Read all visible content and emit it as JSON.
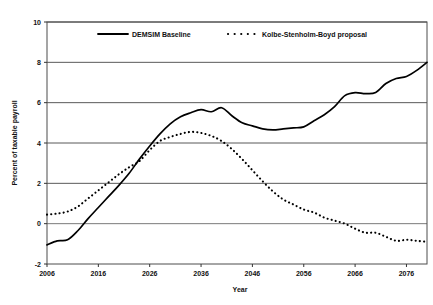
{
  "chart_data": {
    "type": "line",
    "title": "",
    "xlabel": "Year",
    "ylabel": "Percent of taxable payroll",
    "xlim": [
      2006,
      2080
    ],
    "ylim": [
      -2,
      10
    ],
    "xticks": [
      "2006",
      "2016",
      "2026",
      "2036",
      "2046",
      "2056",
      "2066",
      "2076"
    ],
    "xtick_values": [
      2006,
      2016,
      2026,
      2036,
      2046,
      2056,
      2066,
      2076
    ],
    "yticks": [
      "-2",
      "0",
      "2",
      "4",
      "6",
      "8",
      "10"
    ],
    "ytick_values": [
      -2,
      0,
      2,
      4,
      6,
      8,
      10
    ],
    "grid": "horizontal",
    "legend_position": "upper-center-inside",
    "series": [
      {
        "name": "DEMSIM Baseline",
        "style": "solid",
        "color": "#000000",
        "x": [
          2006,
          2008,
          2010,
          2012,
          2014,
          2016,
          2018,
          2020,
          2022,
          2024,
          2026,
          2028,
          2030,
          2032,
          2034,
          2036,
          2038,
          2040,
          2042,
          2044,
          2046,
          2048,
          2050,
          2052,
          2054,
          2056,
          2058,
          2060,
          2062,
          2064,
          2066,
          2068,
          2070,
          2072,
          2074,
          2076,
          2078,
          2080
        ],
        "values": [
          -1.05,
          -0.85,
          -0.8,
          -0.35,
          0.25,
          0.8,
          1.35,
          1.9,
          2.5,
          3.2,
          3.85,
          4.45,
          4.95,
          5.3,
          5.5,
          5.65,
          5.55,
          5.75,
          5.35,
          5.0,
          4.85,
          4.7,
          4.65,
          4.7,
          4.75,
          4.8,
          5.1,
          5.4,
          5.8,
          6.35,
          6.5,
          6.45,
          6.5,
          6.95,
          7.2,
          7.3,
          7.6,
          8.0
        ]
      },
      {
        "name": "Kolbe-Stenholm-Boyd proposal",
        "style": "dotted",
        "color": "#000000",
        "x": [
          2006,
          2008,
          2010,
          2012,
          2014,
          2016,
          2018,
          2020,
          2022,
          2024,
          2026,
          2028,
          2030,
          2032,
          2034,
          2036,
          2038,
          2040,
          2042,
          2044,
          2046,
          2048,
          2050,
          2052,
          2054,
          2056,
          2058,
          2060,
          2062,
          2064,
          2066,
          2068,
          2070,
          2072,
          2074,
          2076,
          2078,
          2080
        ],
        "values": [
          0.45,
          0.5,
          0.6,
          0.85,
          1.25,
          1.65,
          2.05,
          2.45,
          2.8,
          3.1,
          3.65,
          4.1,
          4.3,
          4.45,
          4.55,
          4.5,
          4.35,
          4.1,
          3.7,
          3.2,
          2.65,
          2.1,
          1.6,
          1.2,
          0.95,
          0.7,
          0.55,
          0.3,
          0.15,
          0.0,
          -0.25,
          -0.45,
          -0.45,
          -0.65,
          -0.85,
          -0.8,
          -0.85,
          -0.9
        ]
      }
    ]
  },
  "legend": {
    "items": [
      {
        "label": "DEMSIM Baseline"
      },
      {
        "label": "Kolbe-Stenholm-Boyd proposal"
      }
    ]
  }
}
